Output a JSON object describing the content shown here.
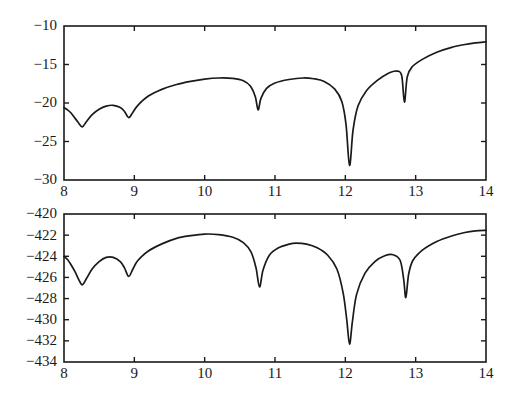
{
  "figure": {
    "background_color": "#ffffff",
    "line_color": "#1a1a1a",
    "width": 517,
    "height": 396
  },
  "chart_data": [
    {
      "type": "line",
      "name": "top-panel",
      "title": "",
      "xlabel": "",
      "ylabel": "",
      "xlim": [
        8,
        14
      ],
      "ylim": [
        -30,
        -10
      ],
      "xticks": [
        8,
        9,
        10,
        11,
        12,
        13,
        14
      ],
      "xticklabels": [
        "8",
        "9",
        "10",
        "11",
        "12",
        "13",
        "14"
      ],
      "yticks": [
        -30,
        -25,
        -20,
        -15,
        -10
      ],
      "yticklabels": [
        "-30",
        "-25",
        "-20",
        "-15",
        "-10"
      ],
      "grid": false,
      "legend": null,
      "notches": [
        {
          "x": 8.26,
          "depth": -23.1
        },
        {
          "x": 8.92,
          "depth": -21.9
        },
        {
          "x": 10.76,
          "depth": -20.9
        },
        {
          "x": 12.06,
          "depth": -28.1
        },
        {
          "x": 12.84,
          "depth": -19.9
        }
      ],
      "series": [
        {
          "name": "response",
          "x": [
            8.0,
            8.05,
            8.1,
            8.15,
            8.2,
            8.26,
            8.32,
            8.4,
            8.5,
            8.6,
            8.7,
            8.8,
            8.86,
            8.92,
            8.98,
            9.05,
            9.2,
            9.4,
            9.6,
            9.8,
            10.0,
            10.2,
            10.4,
            10.55,
            10.65,
            10.72,
            10.76,
            10.8,
            10.88,
            11.0,
            11.2,
            11.4,
            11.55,
            11.7,
            11.85,
            11.95,
            12.01,
            12.06,
            12.11,
            12.18,
            12.3,
            12.45,
            12.6,
            12.72,
            12.8,
            12.84,
            12.88,
            12.95,
            13.1,
            13.3,
            13.5,
            13.7,
            13.85,
            14.0
          ],
          "y": [
            -20.6,
            -20.9,
            -21.3,
            -21.9,
            -22.5,
            -23.1,
            -22.4,
            -21.5,
            -20.8,
            -20.4,
            -20.3,
            -20.6,
            -21.1,
            -21.9,
            -21.2,
            -20.3,
            -19.1,
            -18.2,
            -17.6,
            -17.2,
            -16.9,
            -16.75,
            -16.8,
            -17.1,
            -17.8,
            -19.2,
            -20.9,
            -19.4,
            -18.1,
            -17.4,
            -16.95,
            -16.75,
            -16.85,
            -17.2,
            -18.2,
            -19.8,
            -22.8,
            -28.1,
            -23.5,
            -20.4,
            -18.4,
            -17.1,
            -16.2,
            -15.85,
            -16.4,
            -19.9,
            -16.6,
            -15.3,
            -14.3,
            -13.4,
            -12.8,
            -12.4,
            -12.2,
            -12.05
          ]
        }
      ]
    },
    {
      "type": "line",
      "name": "bottom-panel",
      "title": "",
      "xlabel": "",
      "ylabel": "",
      "xlim": [
        8,
        14
      ],
      "ylim": [
        -434,
        -420
      ],
      "xticks": [
        8,
        9,
        10,
        11,
        12,
        13,
        14
      ],
      "xticklabels": [
        "8",
        "9",
        "10",
        "11",
        "12",
        "13",
        "14"
      ],
      "yticks": [
        -434,
        -432,
        -430,
        -428,
        -426,
        -424,
        -422,
        -420
      ],
      "yticklabels": [
        "-434",
        "-432",
        "-430",
        "-428",
        "-426",
        "-424",
        "-422",
        "-420"
      ],
      "grid": false,
      "legend": null,
      "notches": [
        {
          "x": 8.26,
          "depth": -426.7
        },
        {
          "x": 8.92,
          "depth": -425.9
        },
        {
          "x": 10.78,
          "depth": -426.9
        },
        {
          "x": 12.06,
          "depth": -432.3
        },
        {
          "x": 12.86,
          "depth": -427.9
        }
      ],
      "series": [
        {
          "name": "response",
          "x": [
            8.0,
            8.05,
            8.1,
            8.16,
            8.21,
            8.26,
            8.32,
            8.4,
            8.5,
            8.6,
            8.7,
            8.8,
            8.86,
            8.92,
            8.98,
            9.05,
            9.2,
            9.4,
            9.6,
            9.8,
            10.0,
            10.2,
            10.4,
            10.55,
            10.66,
            10.73,
            10.78,
            10.83,
            10.92,
            11.05,
            11.2,
            11.3,
            11.45,
            11.6,
            11.75,
            11.88,
            11.97,
            12.02,
            12.06,
            12.1,
            12.16,
            12.28,
            12.42,
            12.56,
            12.68,
            12.78,
            12.83,
            12.86,
            12.9,
            12.96,
            13.1,
            13.3,
            13.5,
            13.7,
            13.85,
            14.0
          ],
          "y": [
            -424.0,
            -424.3,
            -424.8,
            -425.5,
            -426.2,
            -426.7,
            -426.1,
            -425.2,
            -424.5,
            -424.1,
            -424.1,
            -424.5,
            -425.1,
            -425.9,
            -425.2,
            -424.4,
            -423.5,
            -422.8,
            -422.3,
            -422.05,
            -421.9,
            -421.95,
            -422.2,
            -422.7,
            -423.6,
            -425.1,
            -426.9,
            -425.3,
            -423.9,
            -423.2,
            -422.85,
            -422.75,
            -422.85,
            -423.2,
            -423.9,
            -425.2,
            -427.5,
            -430.0,
            -432.3,
            -430.2,
            -427.6,
            -425.6,
            -424.5,
            -423.95,
            -423.85,
            -424.4,
            -426.2,
            -427.9,
            -425.7,
            -424.4,
            -423.4,
            -422.6,
            -422.1,
            -421.75,
            -421.6,
            -421.55
          ]
        }
      ]
    }
  ]
}
